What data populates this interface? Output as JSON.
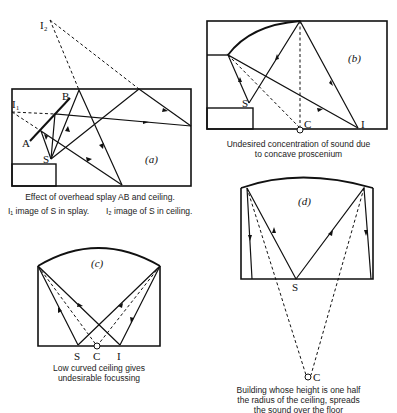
{
  "panels": {
    "a": {
      "tag": "(a)",
      "caption": "Effect of overhead splay AB and ceiling.",
      "legend1": "I₁ image of S in splay.",
      "legend2": "I₂ image of S in ceiling.",
      "labels": {
        "I1": "I₁",
        "I2": "I₂",
        "A": "A",
        "B": "B",
        "S": "S"
      }
    },
    "b": {
      "tag": "(b)",
      "caption_line1": "Undesired concentration of sound due",
      "caption_line2": "to concave proscenium",
      "labels": {
        "S": "S",
        "C": "C",
        "I": "I"
      }
    },
    "c": {
      "tag": "(c)",
      "caption_line1": "Low curved ceiling gives",
      "caption_line2": "undesirable focussing",
      "labels": {
        "S": "S",
        "C": "C",
        "I": "I"
      }
    },
    "d": {
      "tag": "(d)",
      "caption_line1": "Building whose height is one half",
      "caption_line2": "the radius of the ceiling, spreads",
      "caption_line3": "the sound over the floor",
      "labels": {
        "S": "S",
        "C": "C"
      }
    }
  }
}
